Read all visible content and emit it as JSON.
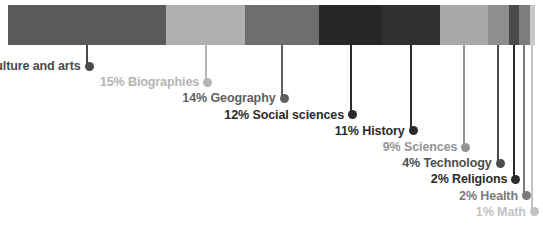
{
  "chart_data": {
    "type": "bar",
    "title": "",
    "subtitle": "",
    "xlabel": "",
    "ylabel": "",
    "orientation": "horizontal-stacked",
    "grid": false,
    "legend_position": "inline-callout-labels",
    "units": "percent",
    "total": 100,
    "categories": [
      "Culture and arts",
      "Biographies",
      "Geography",
      "Social sciences",
      "History",
      "Sciences",
      "Technology",
      "Religions",
      "Health",
      "Math"
    ],
    "values": [
      30,
      15,
      14,
      12,
      11,
      9,
      4,
      2,
      2,
      1
    ],
    "labels": [
      "30% Culture and arts",
      "15% Biographies",
      "14% Geography",
      "12% Social sciences",
      "11% History",
      "9% Sciences",
      "4% Technology",
      "2% Religions",
      "2% Health",
      "1% Math"
    ],
    "colors": [
      "#5b5b5b",
      "#b0b0b0",
      "#6e6e6e",
      "#262626",
      "#2f2f2f",
      "#a8a8a8",
      "#8e8e8e",
      "#4a4a4a",
      "#7d7d7d",
      "#c9c9c9"
    ],
    "label_colors": [
      "#4a4a4a",
      "#b4b4b4",
      "#5f5f5f",
      "#2b2b2b",
      "#2b2b2b",
      "#949494",
      "#4d4d4d",
      "#2b2b2b",
      "#7a7a7a",
      "#c2c2c2"
    ]
  },
  "segments": [
    {
      "name": "culture-and-arts",
      "label": "30% Culture and arts",
      "percent": 30
    },
    {
      "name": "biographies",
      "label": "15% Biographies",
      "percent": 15
    },
    {
      "name": "geography",
      "label": "14% Geography",
      "percent": 14
    },
    {
      "name": "social-sciences",
      "label": "12% Social sciences",
      "percent": 12
    },
    {
      "name": "history",
      "label": "11% History",
      "percent": 11
    },
    {
      "name": "sciences",
      "label": "9% Sciences",
      "percent": 9
    },
    {
      "name": "technology",
      "label": "4% Technology",
      "percent": 4
    },
    {
      "name": "religions",
      "label": "2% Religions",
      "percent": 2
    },
    {
      "name": "health",
      "label": "2% Health",
      "percent": 2
    },
    {
      "name": "math",
      "label": "1% Math",
      "percent": 1
    }
  ]
}
